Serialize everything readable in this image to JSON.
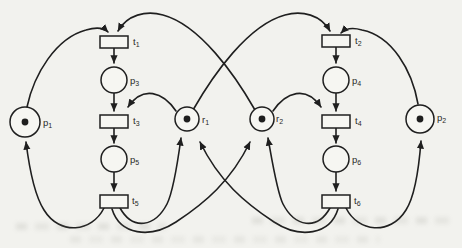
{
  "figure": {
    "type": "petri-net",
    "background": "#f2f2ee",
    "ink": "#1f1f1f",
    "node_fill": "#f6f6f2",
    "places": [
      {
        "id": "p1",
        "label_base": "p",
        "label_sub": "1",
        "x": 25,
        "y": 122,
        "r": 15,
        "token": true,
        "lx": 43,
        "ly": 126
      },
      {
        "id": "p2",
        "label_base": "p",
        "label_sub": "2",
        "x": 420,
        "y": 119,
        "r": 14,
        "token": true,
        "lx": 437,
        "ly": 121
      },
      {
        "id": "p3",
        "label_base": "p",
        "label_sub": "3",
        "x": 114,
        "y": 80,
        "r": 13,
        "token": false,
        "lx": 130,
        "ly": 84
      },
      {
        "id": "p4",
        "label_base": "p",
        "label_sub": "4",
        "x": 336,
        "y": 80,
        "r": 13,
        "token": false,
        "lx": 352,
        "ly": 84
      },
      {
        "id": "p5",
        "label_base": "p",
        "label_sub": "5",
        "x": 114,
        "y": 159,
        "r": 13,
        "token": false,
        "lx": 130,
        "ly": 163
      },
      {
        "id": "p6",
        "label_base": "p",
        "label_sub": "6",
        "x": 336,
        "y": 159,
        "r": 13,
        "token": false,
        "lx": 352,
        "ly": 163
      },
      {
        "id": "r1",
        "label_base": "r",
        "label_sub": "1",
        "x": 187,
        "y": 119,
        "r": 12,
        "token": true,
        "lx": 202,
        "ly": 123
      },
      {
        "id": "r2",
        "label_base": "r",
        "label_sub": "2",
        "x": 262,
        "y": 119,
        "r": 12,
        "token": true,
        "lx": 276,
        "ly": 122
      }
    ],
    "transitions": [
      {
        "id": "t1",
        "label_base": "t",
        "label_sub": "1",
        "x": 100,
        "y": 36,
        "w": 28,
        "h": 12,
        "lx": 133,
        "ly": 45
      },
      {
        "id": "t2",
        "label_base": "t",
        "label_sub": "2",
        "x": 322,
        "y": 35,
        "w": 28,
        "h": 12,
        "lx": 355,
        "ly": 44
      },
      {
        "id": "t3",
        "label_base": "t",
        "label_sub": "3",
        "x": 100,
        "y": 115,
        "w": 28,
        "h": 13,
        "lx": 133,
        "ly": 124
      },
      {
        "id": "t4",
        "label_base": "t",
        "label_sub": "4",
        "x": 322,
        "y": 115,
        "w": 28,
        "h": 13,
        "lx": 355,
        "ly": 124
      },
      {
        "id": "t5",
        "label_base": "t",
        "label_sub": "5",
        "x": 100,
        "y": 195,
        "w": 28,
        "h": 13,
        "lx": 132,
        "ly": 204
      },
      {
        "id": "t6",
        "label_base": "t",
        "label_sub": "6",
        "x": 322,
        "y": 195,
        "w": 28,
        "h": 13,
        "lx": 354,
        "ly": 204
      }
    ],
    "arcs": [
      {
        "from": "p1",
        "to": "t1",
        "path": "M 27,107 C 34,74 56,38 86,30 C 96,27 104,28 108,32"
      },
      {
        "from": "r2",
        "to": "t1",
        "path": "M 255,110 C 235,75 200,25 163,15 C 146,10 127,15 118,31"
      },
      {
        "from": "t1",
        "to": "p3",
        "path": "M 114,48 L 114,63"
      },
      {
        "from": "p3",
        "to": "t3",
        "path": "M 114,93 L 114,111"
      },
      {
        "from": "r1",
        "to": "t3",
        "path": "M 176,111 C 163,92 143,85 128,107"
      },
      {
        "from": "t3",
        "to": "p5",
        "path": "M 114,128 L 114,143"
      },
      {
        "from": "p5",
        "to": "t5",
        "path": "M 114,172 L 114,191"
      },
      {
        "from": "t5",
        "to": "p1",
        "path": "M 104,208 C 92,232 60,236 44,210 C 35,196 29,166 26,142"
      },
      {
        "from": "t5",
        "to": "r1",
        "path": "M 120,208 C 133,231 155,227 167,204 C 173,192 178,160 181,138"
      },
      {
        "from": "t5",
        "to": "r2",
        "path": "M 112,209 C 120,235 150,239 176,222 C 205,203 231,181 250,142"
      },
      {
        "from": "p2",
        "to": "t2",
        "path": "M 418,104 C 412,70 392,36 362,30 C 352,27 345,29 341,33"
      },
      {
        "from": "r1",
        "to": "t2",
        "path": "M 193,110 C 213,75 248,25 285,15 C 302,10 321,15 330,31"
      },
      {
        "from": "t2",
        "to": "p4",
        "path": "M 336,47 L 336,63"
      },
      {
        "from": "p4",
        "to": "t4",
        "path": "M 336,93 L 336,111"
      },
      {
        "from": "r2",
        "to": "t4",
        "path": "M 273,111 C 286,92 306,85 321,107"
      },
      {
        "from": "t4",
        "to": "p6",
        "path": "M 336,128 L 336,143"
      },
      {
        "from": "p6",
        "to": "t6",
        "path": "M 336,172 L 336,191"
      },
      {
        "from": "t6",
        "to": "p2",
        "path": "M 346,208 C 358,232 390,236 406,210 C 415,196 419,167 421,141"
      },
      {
        "from": "t6",
        "to": "r2",
        "path": "M 330,208 C 317,231 295,227 283,204 C 277,192 272,160 268,138"
      },
      {
        "from": "t6",
        "to": "r1",
        "path": "M 338,209 C 330,235 300,239 274,222 C 245,203 219,181 200,142"
      }
    ]
  }
}
